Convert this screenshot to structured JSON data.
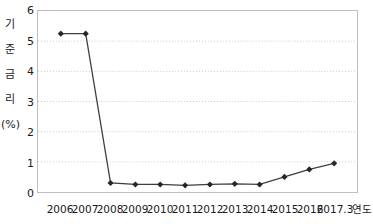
{
  "chart_data": {
    "type": "line",
    "title": "",
    "xlabel": "연도",
    "ylabel": "기\n준\n금\n리\n(%)",
    "ylabel_lines": [
      "기",
      "준",
      "금",
      "리",
      "(%)"
    ],
    "categories": [
      "2006",
      "2007",
      "2008",
      "2009",
      "2010",
      "2011",
      "2012",
      "2013",
      "2014",
      "2015",
      "2016",
      "2017.3"
    ],
    "values": [
      5.25,
      5.25,
      0.3,
      0.25,
      0.25,
      0.22,
      0.25,
      0.27,
      0.25,
      0.5,
      0.75,
      0.95
    ],
    "series": [
      {
        "name": "기준금리",
        "values": [
          5.25,
          5.25,
          0.3,
          0.25,
          0.25,
          0.22,
          0.25,
          0.27,
          0.25,
          0.5,
          0.75,
          0.95
        ]
      }
    ],
    "ylim": [
      0,
      6
    ],
    "yticks": [
      0,
      1,
      2,
      3,
      4,
      5,
      6
    ],
    "ytick_labels": [
      "0",
      "1",
      "2",
      "3",
      "4",
      "5",
      "6"
    ],
    "grid": true,
    "grid_axis": "y",
    "grid_style": "dotted",
    "legend": false,
    "legend_position": "none",
    "marker": "diamond",
    "colors": {
      "line": "#3f3f3f",
      "marker": "#262626",
      "grid": "#c9c9c9",
      "axis": "#bfbfbf",
      "text": "#1a1a1a",
      "background": "#ffffff"
    }
  }
}
